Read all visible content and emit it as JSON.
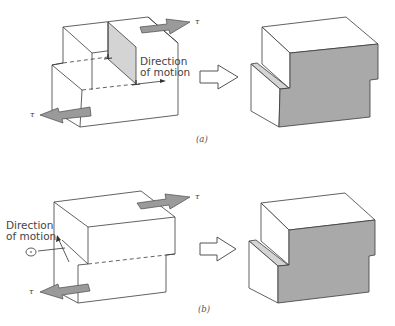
{
  "figure": {
    "panels": [
      {
        "id": "a",
        "caption": "(a)",
        "direction_label_line1": "Direction",
        "direction_label_line2": "of motion",
        "stress_symbol_top": "τ",
        "stress_symbol_bottom": "τ",
        "description": "Edge dislocation: crystal block under shear stress, slip plane shaded, motion parallel to stress"
      },
      {
        "id": "b",
        "caption": "(b)",
        "direction_label_line1": "Direction",
        "direction_label_line2": "of motion",
        "stress_symbol_top": "τ",
        "stress_symbol_bottom": "τ",
        "description": "Screw dislocation: crystal block under shear stress, motion perpendicular to stress"
      }
    ],
    "result_description": "Both lead to the same final deformed block with a step (shaded face)",
    "colors": {
      "shaded_face": "#a9a9a9",
      "light_face": "#d4d4d4",
      "force_arrow": "#9a9a9a",
      "line": "#3a3a3a"
    }
  }
}
